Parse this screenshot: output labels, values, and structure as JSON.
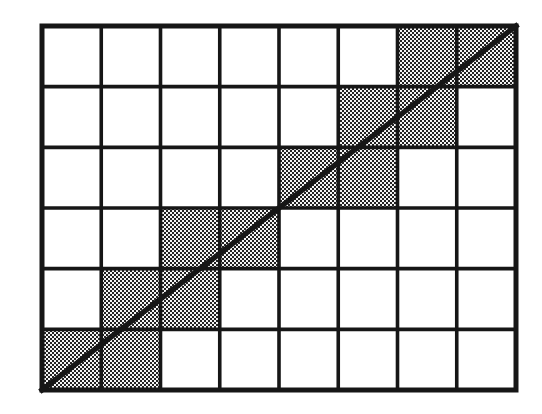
{
  "figure": {
    "title": "Grid with diagonal crossing shaded unit squares"
  },
  "canvas": {
    "width": 542,
    "height": 414,
    "background_color": "#ffffff"
  },
  "chart_data": {
    "type": "heatmap",
    "title": "Grid with diagonal crossing shaded unit squares",
    "subtitle": "",
    "xlabel": "",
    "ylabel": "",
    "columns": 8,
    "rows": 6,
    "xlim": [
      0,
      8
    ],
    "ylim": [
      0,
      6
    ],
    "x_tick_labels": [],
    "y_tick_labels": [],
    "grid": true,
    "legend": false,
    "legend_position": "none",
    "cell_states": [
      [
        0,
        0,
        0,
        0,
        0,
        0,
        1,
        1
      ],
      [
        0,
        0,
        0,
        0,
        0,
        1,
        1,
        0
      ],
      [
        0,
        0,
        0,
        0,
        1,
        1,
        0,
        0
      ],
      [
        0,
        0,
        1,
        1,
        0,
        0,
        0,
        0
      ],
      [
        0,
        1,
        1,
        0,
        0,
        0,
        0,
        0
      ],
      [
        1,
        1,
        0,
        0,
        0,
        0,
        0,
        0
      ]
    ],
    "shaded_cells_row_major": [
      {
        "row": 0,
        "col": 6
      },
      {
        "row": 0,
        "col": 7
      },
      {
        "row": 1,
        "col": 5
      },
      {
        "row": 1,
        "col": 6
      },
      {
        "row": 2,
        "col": 4
      },
      {
        "row": 2,
        "col": 5
      },
      {
        "row": 3,
        "col": 2
      },
      {
        "row": 3,
        "col": 3
      },
      {
        "row": 4,
        "col": 1
      },
      {
        "row": 4,
        "col": 2
      },
      {
        "row": 5,
        "col": 0
      },
      {
        "row": 5,
        "col": 1
      }
    ],
    "shaded_cell_count": 12,
    "annotations": [],
    "series": [
      {
        "name": "diagonal",
        "type": "line",
        "x": [
          0,
          8
        ],
        "y": [
          0,
          6
        ],
        "from_corner": "bottom-left",
        "to_corner": "top-right",
        "slope": 0.75
      }
    ]
  },
  "geometry": {
    "grid_left": 42,
    "grid_top": 26,
    "grid_right": 516,
    "grid_bottom": 390,
    "cell_width": 59.25,
    "cell_height": 60.67,
    "outer_border_width": 5,
    "inner_line_width": 3.6,
    "diagonal_width": 5.4
  },
  "colors": {
    "line_color": "#161616",
    "cell_fill": "#ffffff",
    "shade_dot_color": "#2a2a2a",
    "shade_base_color": "#f2f2f2",
    "background": "#ffffff"
  },
  "icons": {
    "diagonal": "diagonal-line-icon",
    "grid": "grid-icon"
  }
}
